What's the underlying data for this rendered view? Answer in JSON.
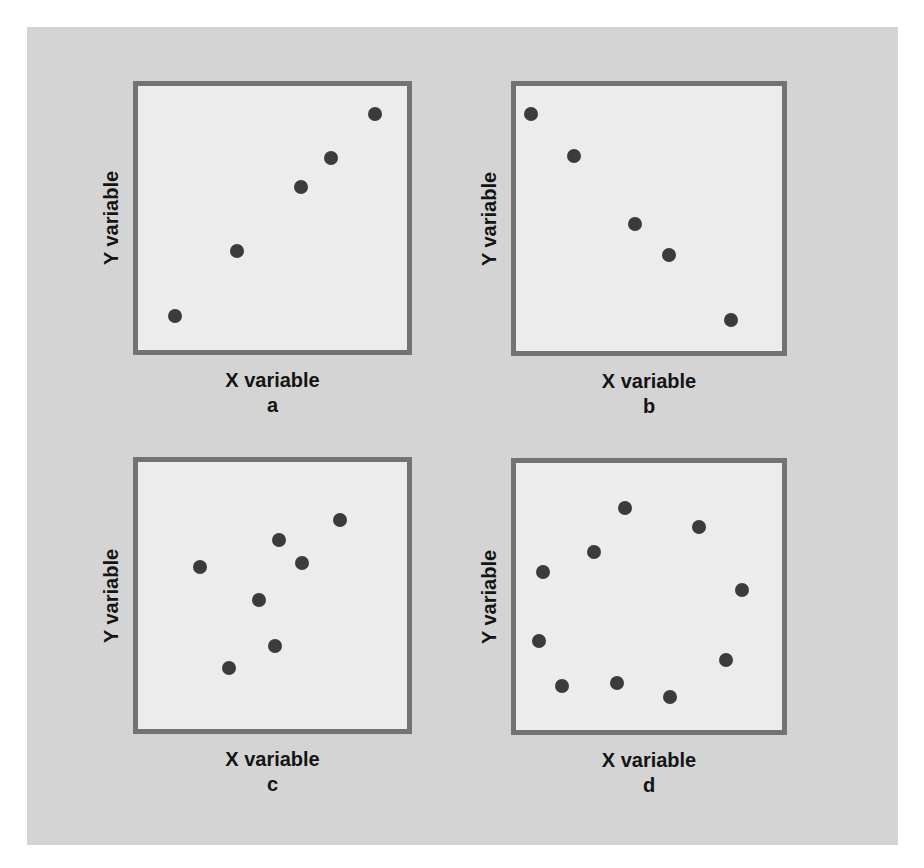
{
  "figure": {
    "background_color": "#d4d4d4",
    "plot_background_color": "#ececec",
    "border_color": "#737373",
    "dot_color": "#3b3b3b"
  },
  "panels": [
    {
      "id": "a",
      "sub_label": "a",
      "x_label": "X variable",
      "y_label": "Y variable",
      "box": {
        "left": 133,
        "top": 81,
        "width": 279,
        "height": 274
      },
      "dots": [
        [
          42,
          235
        ],
        [
          104,
          170
        ],
        [
          168,
          106
        ],
        [
          198,
          77
        ],
        [
          242,
          33
        ]
      ]
    },
    {
      "id": "b",
      "sub_label": "b",
      "x_label": "X variable",
      "y_label": "Y variable",
      "box": {
        "left": 511,
        "top": 81,
        "width": 276,
        "height": 275
      },
      "dots": [
        [
          20,
          33
        ],
        [
          63,
          75
        ],
        [
          124,
          143
        ],
        [
          158,
          174
        ],
        [
          220,
          239
        ]
      ]
    },
    {
      "id": "c",
      "sub_label": "c",
      "x_label": "X variable",
      "y_label": "Y variable",
      "box": {
        "left": 133,
        "top": 457,
        "width": 279,
        "height": 277
      },
      "dots": [
        [
          67,
          110
        ],
        [
          96,
          211
        ],
        [
          126,
          143
        ],
        [
          142,
          189
        ],
        [
          146,
          83
        ],
        [
          169,
          106
        ],
        [
          207,
          63
        ]
      ]
    },
    {
      "id": "d",
      "sub_label": "d",
      "x_label": "X variable",
      "y_label": "Y variable",
      "box": {
        "left": 511,
        "top": 458,
        "width": 276,
        "height": 277
      },
      "dots": [
        [
          114,
          50
        ],
        [
          188,
          69
        ],
        [
          83,
          94
        ],
        [
          32,
          114
        ],
        [
          231,
          132
        ],
        [
          28,
          183
        ],
        [
          215,
          202
        ],
        [
          51,
          228
        ],
        [
          106,
          225
        ],
        [
          159,
          239
        ]
      ]
    }
  ],
  "chart_data": [
    {
      "type": "scatter",
      "title": "a",
      "xlabel": "X variable",
      "ylabel": "Y variable",
      "grid": false,
      "xlim": [
        0,
        100
      ],
      "ylim": [
        0,
        100
      ],
      "x": [
        14,
        37,
        60,
        71,
        87
      ],
      "y": [
        13,
        37,
        61,
        72,
        88
      ],
      "description": "strong positive linear relationship"
    },
    {
      "type": "scatter",
      "title": "b",
      "xlabel": "X variable",
      "ylabel": "Y variable",
      "grid": false,
      "xlim": [
        0,
        100
      ],
      "ylim": [
        0,
        100
      ],
      "x": [
        6,
        22,
        45,
        57,
        80
      ],
      "y": [
        89,
        73,
        47,
        36,
        12
      ],
      "description": "strong negative linear relationship"
    },
    {
      "type": "scatter",
      "title": "c",
      "xlabel": "X variable",
      "ylabel": "Y variable",
      "grid": false,
      "xlim": [
        0,
        100
      ],
      "ylim": [
        0,
        100
      ],
      "x": [
        23,
        34,
        45,
        51,
        52,
        61,
        75
      ],
      "y": [
        61,
        23,
        49,
        32,
        72,
        63,
        79
      ],
      "description": "weak / no clear linear relationship"
    },
    {
      "type": "scatter",
      "title": "d",
      "xlabel": "X variable",
      "ylabel": "Y variable",
      "grid": false,
      "xlim": [
        0,
        100
      ],
      "ylim": [
        0,
        100
      ],
      "x": [
        41,
        68,
        29,
        10,
        84,
        9,
        78,
        17,
        37,
        58
      ],
      "y": [
        83,
        76,
        68,
        60,
        54,
        35,
        28,
        19,
        20,
        15
      ],
      "description": "curvilinear (circular) pattern, no linear relationship"
    }
  ]
}
